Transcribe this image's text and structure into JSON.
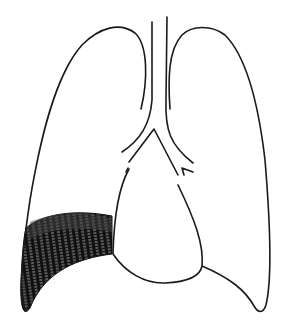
{
  "figure": {
    "subject": "Frontal diagram of lungs, trachea and heart with shaded lower-left lung region",
    "colors": {
      "line": "#1a1a1a",
      "shading": "#111111",
      "background": "#ffffff"
    },
    "parts": [
      "left-lung-outline",
      "right-lung-outline",
      "trachea",
      "bronchi",
      "heart-outline",
      "shaded-opacity-region"
    ]
  }
}
